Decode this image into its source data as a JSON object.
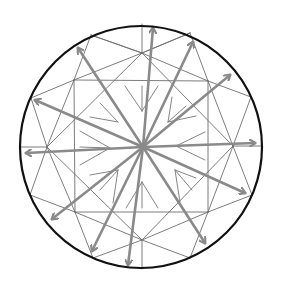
{
  "title": "Diamond facet diagram with light reflection arrows",
  "colors": {
    "background": "#ffffff",
    "girdle_outline": "#111111",
    "facet_lines": "#6e6e6e",
    "inner_marks": "#777777",
    "arrows": "#8a8a8a"
  },
  "girdle": {
    "cx": 141,
    "cy": 147,
    "r": 121
  },
  "center": {
    "x": 143,
    "y": 147
  },
  "facet_lines": [
    [
      142,
      24,
      142,
      53
    ],
    [
      142,
      240,
      142,
      269
    ],
    [
      20,
      147,
      47,
      147
    ],
    [
      261,
      146,
      233,
      146
    ],
    [
      142,
      53,
      91,
      35
    ],
    [
      142,
      53,
      190,
      33
    ],
    [
      142,
      240,
      93,
      258
    ],
    [
      142,
      240,
      190,
      258
    ],
    [
      47,
      147,
      31,
      98
    ],
    [
      47,
      147,
      30,
      195
    ],
    [
      233,
      146,
      251,
      97
    ],
    [
      233,
      146,
      252,
      195
    ],
    [
      74,
      80,
      91,
      35
    ],
    [
      74,
      80,
      31,
      98
    ],
    [
      208,
      81,
      190,
      33
    ],
    [
      208,
      81,
      251,
      97
    ],
    [
      75,
      212,
      30,
      195
    ],
    [
      75,
      212,
      93,
      258
    ],
    [
      208,
      212,
      252,
      195
    ],
    [
      208,
      212,
      190,
      258
    ],
    [
      74,
      80,
      142,
      53
    ],
    [
      142,
      53,
      208,
      81
    ],
    [
      208,
      81,
      233,
      146
    ],
    [
      233,
      146,
      208,
      212
    ],
    [
      208,
      212,
      142,
      240
    ],
    [
      142,
      240,
      75,
      212
    ],
    [
      75,
      212,
      47,
      147
    ],
    [
      47,
      147,
      74,
      80
    ],
    [
      74,
      80,
      208,
      81
    ],
    [
      208,
      81,
      208,
      212
    ],
    [
      208,
      212,
      75,
      212
    ],
    [
      75,
      212,
      74,
      80
    ],
    [
      142,
      53,
      233,
      146
    ],
    [
      233,
      146,
      142,
      240
    ],
    [
      142,
      240,
      47,
      147
    ],
    [
      47,
      147,
      142,
      53
    ],
    [
      91,
      35,
      142,
      53
    ],
    [
      190,
      33,
      142,
      53
    ]
  ],
  "inner_marks": [
    [
      125,
      86,
      142,
      111
    ],
    [
      142,
      86,
      142,
      111
    ],
    [
      158,
      86,
      142,
      111
    ],
    [
      100,
      103,
      118,
      122
    ],
    [
      90,
      117,
      118,
      122
    ],
    [
      172,
      97,
      168,
      122
    ],
    [
      186,
      106,
      168,
      122
    ],
    [
      196,
      116,
      168,
      122
    ],
    [
      80,
      131,
      110,
      148
    ],
    [
      80,
      147,
      110,
      148
    ],
    [
      205,
      132,
      176,
      146
    ],
    [
      205,
      160,
      176,
      146
    ],
    [
      80,
      165,
      110,
      148
    ],
    [
      90,
      175,
      118,
      170
    ],
    [
      100,
      190,
      118,
      170
    ],
    [
      113,
      203,
      118,
      170
    ],
    [
      175,
      170,
      196,
      178
    ],
    [
      175,
      170,
      192,
      190
    ],
    [
      175,
      170,
      180,
      202
    ],
    [
      126,
      208,
      142,
      182
    ],
    [
      142,
      208,
      142,
      182
    ],
    [
      158,
      208,
      142,
      182
    ]
  ],
  "arrows": [
    {
      "name": "arrow-up",
      "x2": 153,
      "y2": 28
    },
    {
      "name": "arrow-up-right-steep",
      "x2": 193,
      "y2": 42
    },
    {
      "name": "arrow-up-right",
      "x2": 230,
      "y2": 75
    },
    {
      "name": "arrow-right",
      "x2": 255,
      "y2": 143
    },
    {
      "name": "arrow-down-right",
      "x2": 245,
      "y2": 193
    },
    {
      "name": "arrow-down-right-steep",
      "x2": 205,
      "y2": 243
    },
    {
      "name": "arrow-down",
      "x2": 128,
      "y2": 265
    },
    {
      "name": "arrow-down-left-steep",
      "x2": 92,
      "y2": 251
    },
    {
      "name": "arrow-down-left",
      "x2": 52,
      "y2": 219
    },
    {
      "name": "arrow-left",
      "x2": 26,
      "y2": 153
    },
    {
      "name": "arrow-up-left",
      "x2": 35,
      "y2": 100
    },
    {
      "name": "arrow-up-left-steep",
      "x2": 78,
      "y2": 48
    }
  ]
}
